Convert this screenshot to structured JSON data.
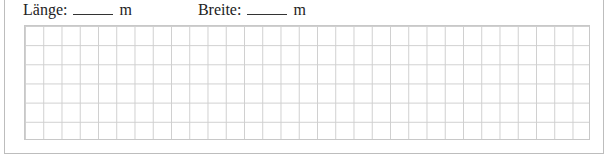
{
  "fields": [
    {
      "label": "Länge:",
      "unit": "m"
    },
    {
      "label": "Breite:",
      "unit": "m"
    }
  ],
  "grid": {
    "columns": 31,
    "rows": 6,
    "line_color": "#cfcfcf"
  }
}
